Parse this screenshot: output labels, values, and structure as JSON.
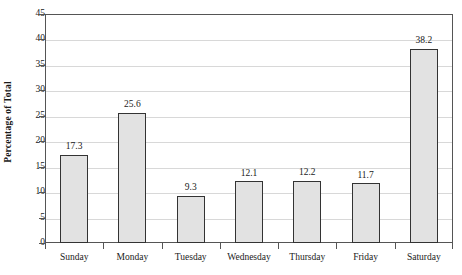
{
  "chart_data": {
    "type": "bar",
    "title": "",
    "xlabel": "",
    "ylabel": "Percentage of Total",
    "categories": [
      "Sunday",
      "Monday",
      "Tuesday",
      "Wednesday",
      "Thursday",
      "Friday",
      "Saturday"
    ],
    "values": [
      17.3,
      25.6,
      9.3,
      12.1,
      12.2,
      11.7,
      38.2
    ],
    "value_labels": [
      "17.3",
      "25.6",
      "9.3",
      "12.1",
      "12.2",
      "11.7",
      "38.2"
    ],
    "ylim": [
      0,
      45
    ],
    "ytick_values": [
      0,
      5,
      10,
      15,
      20,
      25,
      30,
      35,
      40,
      45
    ],
    "ytick_labels": [
      "0",
      "5",
      "10",
      "15",
      "20",
      "25",
      "30",
      "35",
      "40",
      "45"
    ],
    "grid": true,
    "legend": "none",
    "bar_fill_color": "#e2e2e2",
    "bar_border_color": "#333333",
    "gridline_color": "#d8d8d8",
    "axis_color": "#555555",
    "background_color": "#ffffff"
  }
}
